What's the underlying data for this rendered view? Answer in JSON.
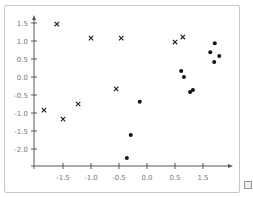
{
  "chart_data": {
    "type": "scatter",
    "title": "",
    "xlabel": "",
    "ylabel": "",
    "x_tick_labels": [
      "-1.5",
      "-1.0",
      "-0.5",
      "0.0",
      "0.5",
      "1.5"
    ],
    "x_tick_values": [
      -1.5,
      -1.0,
      -0.5,
      0.0,
      0.5,
      1.0
    ],
    "y_tick_labels": [
      "1.5",
      "1.0",
      "0.5",
      "0.0",
      "-0.5",
      "-1.0",
      "-1.5",
      "-2.0"
    ],
    "y_tick_values": [
      1.5,
      1.0,
      0.5,
      0.0,
      -0.5,
      -1.0,
      -1.5,
      -2.0
    ],
    "xlim": [
      -2.0,
      1.9
    ],
    "ylim": [
      -2.45,
      1.65
    ],
    "grid": false,
    "legend": null,
    "series": [
      {
        "name": "x-markers",
        "marker": "x",
        "x": [
          -1.61,
          -1.0,
          -0.46,
          -0.55,
          -1.84,
          -1.5,
          -1.23,
          0.5,
          0.64
        ],
        "y": [
          1.47,
          1.08,
          1.08,
          -0.33,
          -0.92,
          -1.17,
          -0.75,
          0.97,
          1.11
        ]
      },
      {
        "name": "dots",
        "marker": "o",
        "x": [
          -0.13,
          -0.29,
          -0.36,
          1.21,
          1.13,
          1.29,
          1.2,
          0.61,
          0.66,
          0.77,
          0.82
        ],
        "y": [
          -0.69,
          -1.61,
          -2.25,
          0.94,
          0.69,
          0.58,
          0.42,
          0.17,
          0.0,
          -0.42,
          -0.36
        ]
      }
    ]
  },
  "icons": {
    "corner": "image-placeholder-icon"
  }
}
